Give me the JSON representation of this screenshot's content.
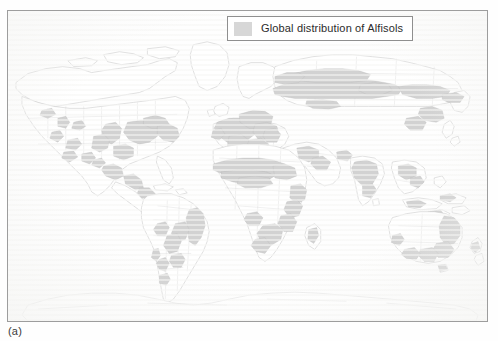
{
  "figure": {
    "panel_label": "(a)",
    "frame": {
      "border_color": "#9d9d9d",
      "background_color": "#fefefe",
      "x": 7,
      "y": 10,
      "width": 481,
      "height": 312
    }
  },
  "legend": {
    "label": "Global distribution of Alfisols",
    "swatch_color": "#d7d7d7",
    "border_color": "#8f8f8f",
    "background_color": "#ffffff"
  },
  "map": {
    "type": "world-thematic-map",
    "projection": "robinson-like",
    "coastline_color": "#c9c9c9",
    "country_border_color": "#d5d5d5",
    "ocean_color": "#fefefe",
    "land_color": "#ffffff",
    "highlight_color": "#d2d2d2",
    "highlight_stroke_color": "#b4b4b4",
    "theme": "Global distribution of Alfisols",
    "regions_with_alfisols": [
      "Central United States",
      "Midwest United States",
      "Great Lakes region",
      "Western United States interior",
      "Mexico",
      "Central America",
      "Eastern Brazil",
      "Central Brazil",
      "Northern Argentina",
      "Paraguay",
      "Sahel belt of West Africa",
      "Southern Sudan",
      "East Africa",
      "Southern Africa",
      "Madagascar",
      "Western Europe",
      "Central Europe",
      "Eastern Europe",
      "European Russia",
      "Western Siberia",
      "Central Siberia",
      "Turkey and Caucasus",
      "Iran",
      "India",
      "Indochina",
      "Eastern China",
      "Korea",
      "Eastern Australia",
      "Southern Australia",
      "New Zealand"
    ]
  }
}
